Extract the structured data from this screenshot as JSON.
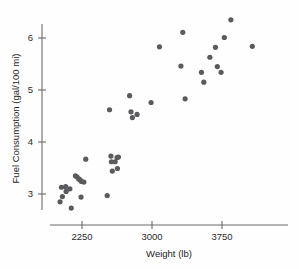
{
  "chart_data": {
    "type": "scatter",
    "title": "",
    "xlabel": "Weight (lb)",
    "ylabel": "Fuel Consumption (gal/100 mi)",
    "xlim": [
      1950,
      4150
    ],
    "ylim": [
      2.55,
      6.45
    ],
    "xticks": [
      2250,
      3000,
      3750
    ],
    "xtick_labels": [
      "2250",
      "3000",
      "3750"
    ],
    "yticks": [
      3,
      4,
      5,
      6
    ],
    "ytick_labels": [
      "3",
      "4",
      "5",
      "6"
    ],
    "grid": false,
    "legend": null,
    "marker": "filled-circle",
    "marker_color": "#5b5b5f",
    "axis_color": "#6a6a6a",
    "points": [
      {
        "x": 2015,
        "y": 2.85
      },
      {
        "x": 2030,
        "y": 3.13
      },
      {
        "x": 2040,
        "y": 2.95
      },
      {
        "x": 2075,
        "y": 3.14
      },
      {
        "x": 2080,
        "y": 3.05
      },
      {
        "x": 2120,
        "y": 3.1
      },
      {
        "x": 2135,
        "y": 2.73
      },
      {
        "x": 2180,
        "y": 3.35
      },
      {
        "x": 2195,
        "y": 3.33
      },
      {
        "x": 2215,
        "y": 3.29
      },
      {
        "x": 2230,
        "y": 3.27
      },
      {
        "x": 2245,
        "y": 3.24
      },
      {
        "x": 2240,
        "y": 2.94
      },
      {
        "x": 2270,
        "y": 3.23
      },
      {
        "x": 2290,
        "y": 3.67
      },
      {
        "x": 2520,
        "y": 2.97
      },
      {
        "x": 2545,
        "y": 4.62
      },
      {
        "x": 2560,
        "y": 3.73
      },
      {
        "x": 2565,
        "y": 3.62
      },
      {
        "x": 2575,
        "y": 3.44
      },
      {
        "x": 2605,
        "y": 3.62
      },
      {
        "x": 2625,
        "y": 3.7
      },
      {
        "x": 2630,
        "y": 3.49
      },
      {
        "x": 2640,
        "y": 3.71
      },
      {
        "x": 2760,
        "y": 4.89
      },
      {
        "x": 2775,
        "y": 4.58
      },
      {
        "x": 2790,
        "y": 4.47
      },
      {
        "x": 2840,
        "y": 4.53
      },
      {
        "x": 2990,
        "y": 4.76
      },
      {
        "x": 3080,
        "y": 5.83
      },
      {
        "x": 3310,
        "y": 5.46
      },
      {
        "x": 3330,
        "y": 6.11
      },
      {
        "x": 3355,
        "y": 4.83
      },
      {
        "x": 3530,
        "y": 5.34
      },
      {
        "x": 3555,
        "y": 5.15
      },
      {
        "x": 3620,
        "y": 5.63
      },
      {
        "x": 3680,
        "y": 5.82
      },
      {
        "x": 3700,
        "y": 5.45
      },
      {
        "x": 3740,
        "y": 5.34
      },
      {
        "x": 3775,
        "y": 6.01
      },
      {
        "x": 3845,
        "y": 6.35
      },
      {
        "x": 4075,
        "y": 5.84
      }
    ]
  },
  "axes": {
    "x_axis_name": "weight-axis",
    "y_axis_name": "fuel-consumption-axis"
  }
}
